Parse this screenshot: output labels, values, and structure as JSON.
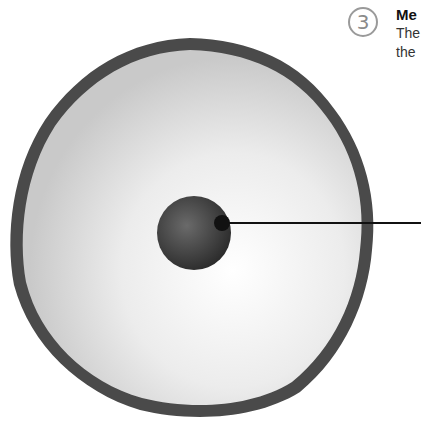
{
  "step": {
    "number": "3"
  },
  "label": {
    "title": "Me",
    "body_line1": "The",
    "body_line2": "the"
  },
  "diagram": {
    "parts": [
      "cell-membrane",
      "cytoplasm",
      "nucleus",
      "leader-line"
    ],
    "colors": {
      "membrane": "#4a4a4a",
      "cytoplasm": "#efefef",
      "nucleus": "#3c3c3c",
      "line": "#111111"
    }
  }
}
